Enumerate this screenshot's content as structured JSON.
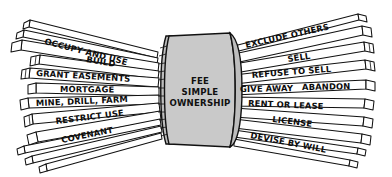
{
  "diagram": {
    "center": {
      "lines": [
        "FEE",
        "SIMPLE",
        "OWNERSHIP"
      ],
      "fill_color": "#c9c9c9",
      "stroke_color": "#111111"
    },
    "background_color": "#ffffff",
    "left_sticks": [
      {
        "label": "OCCUPY AND USE",
        "x": 44,
        "y": 44,
        "rotate": 14.5
      },
      {
        "label": "BUILD",
        "x": 86,
        "y": 62,
        "rotate": 9.5
      },
      {
        "label": "GRANT EASEMENTS",
        "x": 36,
        "y": 76,
        "rotate": 3.5
      },
      {
        "label": "MORTGAGE",
        "x": 60,
        "y": 92,
        "rotate": 0.5
      },
      {
        "label": "MINE, DRILL, FARM",
        "x": 36,
        "y": 106,
        "rotate": -2.5
      },
      {
        "label": "RESTRICT USE",
        "x": 56,
        "y": 124,
        "rotate": -7.0
      },
      {
        "label": "COVENANT",
        "x": 62,
        "y": 143,
        "rotate": -11.5
      }
    ],
    "right_sticks": [
      {
        "label": "EXCLUDE OTHERS",
        "x": 246,
        "y": 48,
        "rotate": -12.5
      },
      {
        "label": "SELL",
        "x": 288,
        "y": 62,
        "rotate": -8.5
      },
      {
        "label": "REFUSE TO SELL",
        "x": 252,
        "y": 78,
        "rotate": -4.5
      },
      {
        "label": "GIVE AWAY",
        "x": 240,
        "y": 92,
        "rotate": -1.0
      },
      {
        "label": "ABANDON",
        "x": 302,
        "y": 90,
        "rotate": -1.0
      },
      {
        "label": "RENT OR LEASE",
        "x": 248,
        "y": 106,
        "rotate": 2.5
      },
      {
        "label": "LICENSE",
        "x": 272,
        "y": 122,
        "rotate": 7.0
      },
      {
        "label": "DEVISE BY WILL",
        "x": 250,
        "y": 138,
        "rotate": 11.0
      }
    ]
  }
}
